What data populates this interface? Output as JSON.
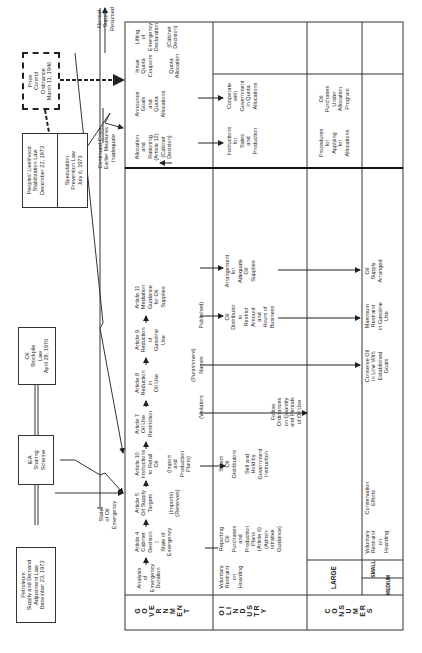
{
  "laws": {
    "petroleum": "Petroleum\nSupply and Demand\nAdjustment Law\nDecember 23, 1973",
    "iea": "IEA\nSharing\nScheme",
    "stockpile": "Oil\nStockpile\nLaw\nApril 28, 1976",
    "peoples": "Peoples' Livelihood\nStabilization Law\nDecember 22, 1973",
    "speculation": "Speculation\nPrevention Law\nJuly 6, 1973",
    "price_control": "Price\nControl\nOrdinance\nMarch 11, 1946"
  },
  "triggers": {
    "state_of_oil_emergency": "State\nof Oil\nEmergency",
    "continued_crisis": "Continued Crisis\nEarlier Measures\nInadequate",
    "normal_supply": "Normal\nSupply\nResumed"
  },
  "row_labels": {
    "government": "G\nO\nV\nE\nR\nN\nM\nE\nN\nT",
    "oil_industry": "O\nI\nL\n \nI\nN\nD\nU\nS\nT\nR\nY",
    "consumers": "C\nO\nN\nS\nU\nM\nE\nR\nS",
    "large": "LARGE",
    "small": "SMALL",
    "medium": "MEDIUM"
  },
  "government": {
    "analysis": "Analysis\nof\nEmergency\nDuration",
    "article4": "Article 4\nCabinet\nDecision\n|\nState of\nEmergency",
    "article5": "Article 5\nOil Supply\nTargets",
    "article5_note": "(Imports)\n(Reserves)",
    "article10": "Article 10\nInstructions\nto Retail\nOil",
    "article10_note": "(Import\nand\nProduction\nPlans)",
    "article7": "Article 7\nOil Use\nRestriction",
    "article8": "Article 8\nReduction\nin\nOil Use",
    "article9": "Article 9\nReduction\nof\nGasoline\nUse",
    "article11": "Article 11\nMediation\nGuidance\nfor Oil\nSupplies",
    "violators": "(Violators",
    "punishment": "(Punishment)",
    "names": "Names",
    "published": "Published)",
    "allocation": "Allocation\nand\nRationing\n(Article 12)\n(Cabinet\nDecision)",
    "announce": "Announce\nGoals\nand\nQuota\nAllocations",
    "issue": "Issue\nQuota\nCoupons",
    "quota_allocation": "Quota\nAllocation",
    "lifting": "Lifting\nof\nEmergency\nDeclaration",
    "cabinet_decision": "(Cabinet\nDecision)"
  },
  "oil_industry": {
    "voluntary": "Voluntary\nRestraint\non\nHoarding",
    "reporting": "Reporting\nOil\nPurchases\nand\nProduction\nPlans\n(Article 6)\n(Admin-\nistrative\nGuidance)",
    "select": "Select\nOil\nDistributors",
    "sell_hold": "Sell and\nHold by\nGovernment\nInstruction",
    "follow": "Follow\nOrdinances\non Quantity\nand Periods\nof Oil Use",
    "distributor": "Oil\nDistributor\nto\nRestrict\nAmount\nand\nHours of\nBusiness",
    "arrangement": "Arrangement\nfor\nAdequate\nOil\nSupplies",
    "instructions": "Instructions\nfor\nSales\nand\nProduction",
    "cooperate": "Cooperate\nwith\nGovernment\nin Quota\nAllocations"
  },
  "consumers": {
    "voluntary": "Voluntary\nRestraint\non\nHoarding",
    "conservation": "Conservation\nEfforts",
    "conserve": "Conserve Oil\nin Line With\nEstablished\nGoals",
    "maximum": "Maximum\nRestraint\nin Gasoline\nUse",
    "oil_supply": "Oil\nSupply\nArranged",
    "procedures": "Procedures\nfor\nApplying\nfor\nAllocations",
    "purchases": "Oil\nPurchases\nUnder\nAllocation\nProgram"
  }
}
